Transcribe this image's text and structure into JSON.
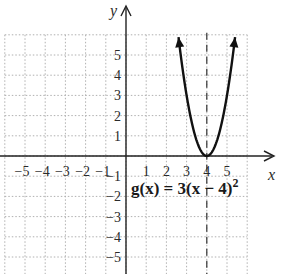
{
  "chart_data": {
    "type": "line",
    "title": "",
    "xlabel": "x",
    "ylabel": "y",
    "xlim": [
      -6,
      6
    ],
    "ylim": [
      -6,
      6
    ],
    "grid": true,
    "x_ticks": [
      "-5",
      "-4",
      "-3",
      "-2",
      "-1",
      "1",
      "2",
      "3",
      "4",
      "5"
    ],
    "y_ticks": [
      "5",
      "4",
      "3",
      "2",
      "1",
      "-1",
      "-2",
      "-3",
      "-4",
      "-5"
    ],
    "series": [
      {
        "name": "g(x) = 3(x − 4)²",
        "expression": "3*(x-4)^2",
        "x": [
          2.6,
          3.0,
          3.5,
          4.0,
          4.5,
          5.0,
          5.4
        ],
        "y": [
          5.88,
          3.0,
          0.75,
          0.0,
          0.75,
          3.0,
          5.88
        ]
      }
    ],
    "annotations": [
      {
        "type": "dashed-vertical-line",
        "x": 4,
        "label": "axis of symmetry"
      },
      {
        "type": "label",
        "text": "g(x) = 3(x − 4)²",
        "x": 0.7,
        "y": -1.9
      }
    ],
    "vertex": [
      4,
      0
    ]
  },
  "labels": {
    "x_axis": "x",
    "y_axis": "y",
    "formula": "g(x) = 3(x − 4)",
    "formula_exp": "2"
  },
  "colors": {
    "curve": "#111111",
    "axes": "#222222",
    "grid": "#b0b0b0"
  }
}
